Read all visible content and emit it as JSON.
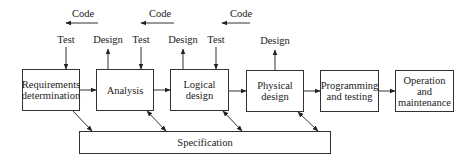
{
  "diagram": {
    "type": "system-development-life-cycle",
    "stages": [
      {
        "id": "requirements",
        "label": "Requirements determination"
      },
      {
        "id": "analysis",
        "label": "Analysis"
      },
      {
        "id": "logical",
        "label": "Logical design"
      },
      {
        "id": "physical",
        "label": "Physical design"
      },
      {
        "id": "programming",
        "label": "Programming and testing"
      },
      {
        "id": "operation",
        "label": "Operation and maintenance"
      }
    ],
    "specification": {
      "label": "Specification"
    },
    "code_labels": [
      "Code",
      "Code",
      "Code"
    ],
    "test_labels": [
      "Test",
      "Test",
      "Test"
    ],
    "design_labels": [
      "Design",
      "Design",
      "Design"
    ]
  }
}
